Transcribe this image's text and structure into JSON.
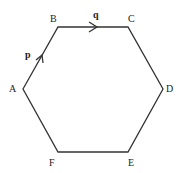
{
  "diagram": {
    "type": "regular-hexagon",
    "vertices": [
      {
        "label": "A",
        "x": 23,
        "y": 89
      },
      {
        "label": "B",
        "x": 58,
        "y": 27
      },
      {
        "label": "C",
        "x": 128,
        "y": 27
      },
      {
        "label": "D",
        "x": 163,
        "y": 89
      },
      {
        "label": "E",
        "x": 128,
        "y": 152
      },
      {
        "label": "F",
        "x": 58,
        "y": 152
      }
    ],
    "vectors": [
      {
        "name": "p",
        "from": "A",
        "to": "B"
      },
      {
        "name": "q",
        "from": "B",
        "to": "C"
      }
    ],
    "line_color": "#333333"
  }
}
